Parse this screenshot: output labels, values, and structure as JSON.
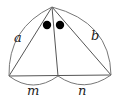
{
  "diagram": {
    "type": "geometry-triangle-angle-bisector",
    "labels": {
      "left_side": "a",
      "right_side": "b",
      "base_left_segment": "m",
      "base_right_segment": "n"
    },
    "points": {
      "apex": [
        52,
        7
      ],
      "base_left": [
        9,
        76
      ],
      "base_foot": [
        58,
        76
      ],
      "base_right": [
        111,
        75
      ]
    },
    "angle_markers": {
      "count": 2,
      "style": "filled-dots",
      "color": "#000000"
    },
    "colors": {
      "line": "#555555",
      "label": "#222222",
      "background": "#ffffff"
    }
  }
}
